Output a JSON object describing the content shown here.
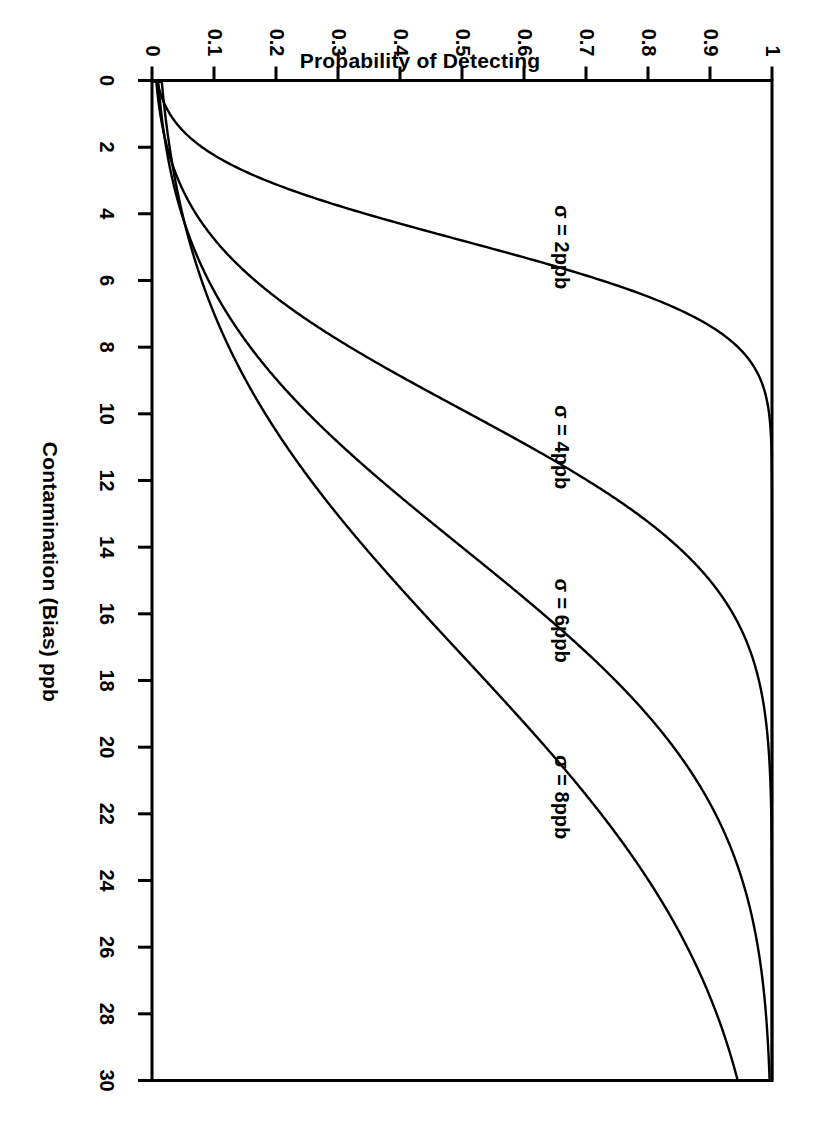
{
  "figure": {
    "rotation_degrees": 90,
    "background_color": "#ffffff",
    "line_color": "#000000",
    "axis_color": "#000000"
  },
  "axes": {
    "x_title": "Contamination (Bias) ppb",
    "y_title": "Probability of Detecting",
    "x_ticks": [
      "0",
      "2",
      "4",
      "6",
      "8",
      "10",
      "12",
      "14",
      "16",
      "18",
      "20",
      "22",
      "24",
      "26",
      "28",
      "30"
    ],
    "y_ticks": [
      "0",
      "0.1",
      "0.2",
      "0.3",
      "0.4",
      "0.5",
      "0.6",
      "0.7",
      "0.8",
      "0.9",
      "1"
    ]
  },
  "annotations": [
    {
      "text": "σ = 2ppb",
      "x": 5.0,
      "y": 0.66
    },
    {
      "text": "σ = 4ppb",
      "x": 11.0,
      "y": 0.66
    },
    {
      "text": "σ = 6ppb",
      "x": 16.2,
      "y": 0.66
    },
    {
      "text": "σ = 8ppb",
      "x": 21.5,
      "y": 0.66
    }
  ],
  "chart_data": {
    "type": "line",
    "title": "",
    "xlabel": "Contamination (Bias) ppb",
    "ylabel": "Probability of Detecting",
    "xlim": [
      0,
      30
    ],
    "ylim": [
      0,
      1
    ],
    "xticks": [
      0,
      2,
      4,
      6,
      8,
      10,
      12,
      14,
      16,
      18,
      20,
      22,
      24,
      26,
      28,
      30
    ],
    "yticks": [
      0,
      0.1,
      0.2,
      0.3,
      0.4,
      0.5,
      0.6,
      0.7,
      0.8,
      0.9,
      1
    ],
    "grid": false,
    "legend": "inline-annotations",
    "x": [
      0,
      1,
      2,
      3,
      4,
      5,
      6,
      7,
      8,
      9,
      10,
      11,
      12,
      13,
      14,
      15,
      16,
      17,
      18,
      19,
      20,
      21,
      22,
      23,
      24,
      25,
      26,
      27,
      28,
      29,
      30
    ],
    "series": [
      {
        "name": "σ = 2ppb",
        "sigma": 2,
        "values": [
          0.0,
          0.02,
          0.09,
          0.22,
          0.38,
          0.53,
          0.66,
          0.76,
          0.84,
          0.89,
          0.93,
          0.955,
          0.972,
          0.983,
          0.99,
          0.994,
          0.997,
          0.998,
          0.999,
          1.0,
          1.0,
          1.0,
          1.0,
          1.0,
          1.0,
          1.0,
          1.0,
          1.0,
          1.0,
          1.0,
          1.0
        ]
      },
      {
        "name": "σ = 4ppb",
        "sigma": 4,
        "values": [
          0.0,
          0.005,
          0.02,
          0.05,
          0.09,
          0.145,
          0.21,
          0.28,
          0.36,
          0.43,
          0.51,
          0.58,
          0.645,
          0.705,
          0.76,
          0.805,
          0.845,
          0.878,
          0.905,
          0.928,
          0.946,
          0.96,
          0.971,
          0.98,
          0.986,
          0.99,
          0.994,
          0.996,
          0.997,
          0.998,
          0.999
        ]
      },
      {
        "name": "σ = 6ppb",
        "sigma": 6,
        "values": [
          0.0,
          0.003,
          0.012,
          0.028,
          0.05,
          0.08,
          0.115,
          0.155,
          0.2,
          0.25,
          0.3,
          0.35,
          0.4,
          0.45,
          0.5,
          0.548,
          0.594,
          0.637,
          0.678,
          0.715,
          0.75,
          0.78,
          0.808,
          0.833,
          0.855,
          0.875,
          0.893,
          0.908,
          0.922,
          0.933,
          0.943
        ]
      },
      {
        "name": "σ = 8ppb",
        "sigma": 8,
        "values": [
          0.0,
          0.002,
          0.008,
          0.019,
          0.034,
          0.054,
          0.078,
          0.106,
          0.137,
          0.172,
          0.21,
          0.248,
          0.288,
          0.329,
          0.37,
          0.411,
          0.452,
          0.491,
          0.529,
          0.566,
          0.601,
          0.635,
          0.667,
          0.697,
          0.725,
          0.751,
          0.775,
          0.797,
          0.817,
          0.836,
          0.853
        ]
      }
    ]
  }
}
